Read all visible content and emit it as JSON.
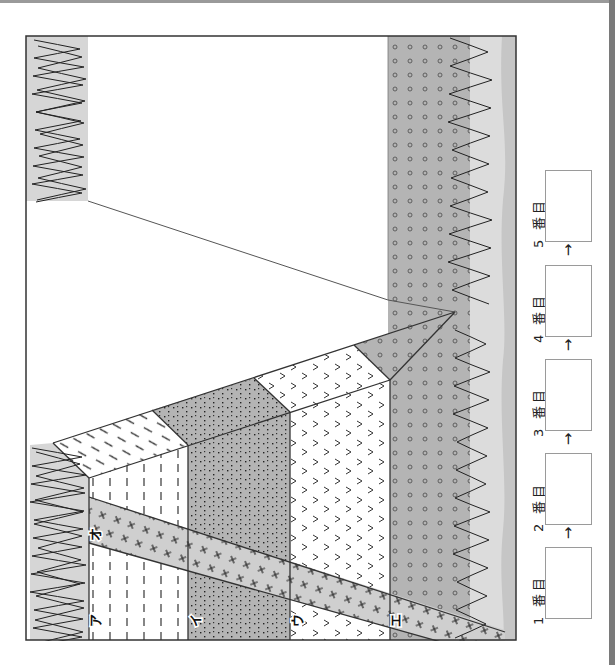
{
  "diagram": {
    "type": "geologic-cross-section",
    "orientation": "rotated-90-ccw",
    "layer_labels": [
      {
        "id": "a",
        "label": "ア",
        "pattern": "dashes",
        "fill": "#ffffff"
      },
      {
        "id": "i",
        "label": "イ",
        "pattern": "dots",
        "fill": "#b4b4b4"
      },
      {
        "id": "u",
        "label": "ウ",
        "pattern": "chevrons",
        "fill": "#ffffff"
      },
      {
        "id": "e",
        "label": "エ",
        "pattern": "circles",
        "fill": "#b4b4b4"
      },
      {
        "id": "o",
        "label": "オ",
        "pattern": "crosses",
        "fill": "#cfcfcf"
      }
    ],
    "colors": {
      "frame": "#333333",
      "surface_light": "#dcdcdc",
      "surface_band": "#c8c8c8",
      "grey_layer": "#b4b4b4",
      "dike": "#cfcfcf",
      "page_edge": "#7a7a7a"
    }
  },
  "answer": {
    "slots": [
      {
        "label": "1 番目"
      },
      {
        "label": "2 番目"
      },
      {
        "label": "3 番目"
      },
      {
        "label": "4 番目"
      },
      {
        "label": "5 番目"
      }
    ],
    "arrow": "→"
  }
}
